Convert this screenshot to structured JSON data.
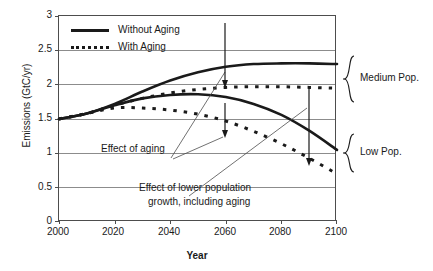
{
  "chart_data": {
    "type": "line",
    "title": "",
    "xlabel": "Year",
    "ylabel": "Emissions (GtC/yr)",
    "xlim": [
      2000,
      2100
    ],
    "ylim": [
      0,
      3
    ],
    "xticks": [
      "2000",
      "2020",
      "2040",
      "2060",
      "2080",
      "2100"
    ],
    "yticks": [
      "0",
      "0.5",
      "1",
      "1.5",
      "2",
      "2.5",
      "3"
    ],
    "grid": "horizontal",
    "legend_position": "top-left-inside",
    "x": [
      2000,
      2010,
      2020,
      2030,
      2040,
      2050,
      2060,
      2070,
      2080,
      2090,
      2100
    ],
    "series": [
      {
        "name": "Medium Pop. - Without Aging",
        "style": "solid",
        "group": "Medium Pop.",
        "values": [
          1.5,
          1.58,
          1.72,
          1.9,
          2.06,
          2.18,
          2.26,
          2.3,
          2.31,
          2.31,
          2.3
        ]
      },
      {
        "name": "Medium Pop. - With Aging",
        "style": "dotted",
        "group": "Medium Pop.",
        "values": [
          1.5,
          1.58,
          1.7,
          1.8,
          1.88,
          1.93,
          1.96,
          1.97,
          1.97,
          1.96,
          1.95
        ]
      },
      {
        "name": "Low Pop. - Without Aging",
        "style": "solid",
        "group": "Low Pop.",
        "values": [
          1.5,
          1.58,
          1.7,
          1.8,
          1.85,
          1.86,
          1.82,
          1.72,
          1.56,
          1.33,
          1.05
        ]
      },
      {
        "name": "Low Pop. - With Aging",
        "style": "dotted",
        "group": "Low Pop.",
        "values": [
          1.5,
          1.58,
          1.66,
          1.66,
          1.63,
          1.57,
          1.47,
          1.32,
          1.14,
          0.93,
          0.7
        ]
      }
    ],
    "annotations": [
      {
        "text": "Effect of aging",
        "x": 2022,
        "y": 1.18
      },
      {
        "text": "Effect of lower population",
        "x": 2038,
        "y": 0.7
      },
      {
        "text": "growth, including aging",
        "x": 2040,
        "y": 0.55
      }
    ],
    "group_labels": [
      {
        "text": "Medium Pop.",
        "range": [
          1.95,
          2.3
        ]
      },
      {
        "text": "Low Pop.",
        "range": [
          0.7,
          1.05
        ]
      }
    ]
  },
  "legend": {
    "items": [
      {
        "label": "Without Aging",
        "style": "solid"
      },
      {
        "label": "With Aging",
        "style": "dotted"
      }
    ]
  },
  "axes": {
    "y_title": "Emissions (GtC/yr)",
    "x_title": "Year",
    "y_ticks": [
      "3",
      "2.5",
      "2",
      "1.5",
      "1",
      "0.5",
      "0"
    ],
    "x_ticks": [
      "2000",
      "2020",
      "2040",
      "2060",
      "2080",
      "2100"
    ]
  },
  "annotations": {
    "effect_of_aging": "Effect of aging",
    "effect_lower_pop_line1": "Effect of lower population",
    "effect_lower_pop_line2": "growth, including aging"
  },
  "braces": {
    "medium": "Medium Pop.",
    "low": "Low Pop."
  },
  "colors": {
    "line": "#1a1a1a",
    "grid": "#8c8c8c",
    "frame": "#4d4d4d",
    "background": "#ffffff"
  }
}
